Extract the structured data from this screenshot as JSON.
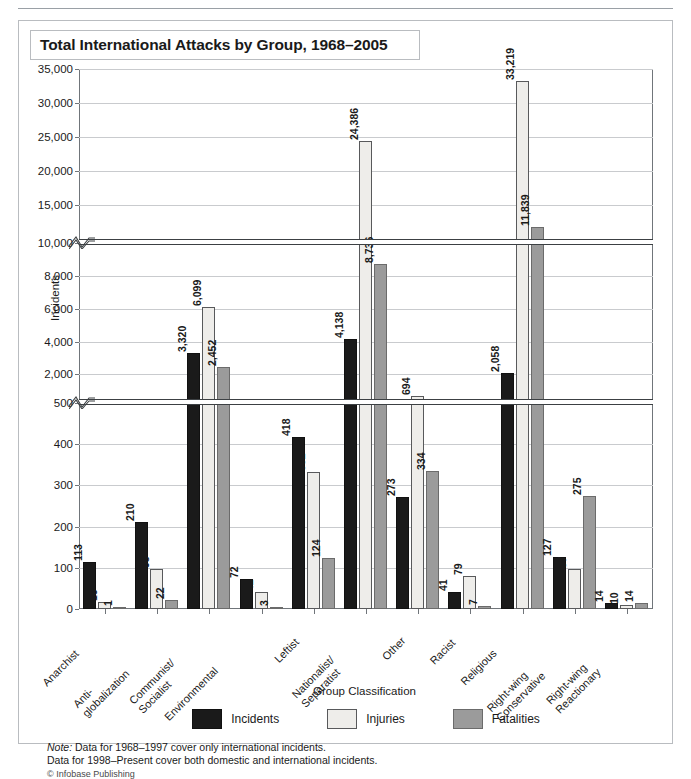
{
  "figure": {
    "title": "Total International Attacks by Group, 1968–2005",
    "credit": "© Infobase Publishing",
    "note_line1_label": "Note:",
    "note_line1": " Data for 1968–1997 cover only international incidents.",
    "note_line2": "Data for 1998–Present cover both domestic and international incidents."
  },
  "legend": {
    "position": "bottom-center",
    "items": [
      {
        "label": "Incidents",
        "color": "#1a1a1a",
        "key": "incidents"
      },
      {
        "label": "Injuries",
        "color": "#eeedea",
        "key": "injuries"
      },
      {
        "label": "Fatalities",
        "color": "#9b9b9b",
        "key": "fatalities"
      }
    ]
  },
  "chart_data": {
    "type": "bar",
    "title": "Total International Attacks by Group, 1968–2005",
    "xlabel": "Group Classification",
    "ylabel": "Incidents",
    "grid": true,
    "broken_axis": true,
    "axis_segments": [
      {
        "min": 0,
        "max": 500,
        "ticks": [
          0,
          100,
          200,
          300,
          400,
          500
        ]
      },
      {
        "min": 500,
        "max": 10000,
        "ticks": [
          2000,
          4000,
          6000,
          8000,
          10000
        ]
      },
      {
        "min": 10000,
        "max": 35000,
        "ticks": [
          15000,
          20000,
          25000,
          30000,
          35000
        ]
      }
    ],
    "tick_labels": [
      "0",
      "100",
      "200",
      "300",
      "400",
      "500",
      "2,000",
      "4,000",
      "6,000",
      "8,000",
      "10,000",
      "15,000",
      "20,000",
      "25,000",
      "30,000",
      "35,000"
    ],
    "categories": [
      "Anarchist",
      "Anti-globalization",
      "Communist/Socialist",
      "Environmental",
      "Leftist",
      "Nationalist/Separatist",
      "Other",
      "Racist",
      "Religious",
      "Right-wing Conservative",
      "Right-wing Reactionary"
    ],
    "category_lines": [
      [
        "Anarchist"
      ],
      [
        "Anti-",
        "globalization"
      ],
      [
        "Communist/",
        "Socialist"
      ],
      [
        "Environmental"
      ],
      [
        "Leftist"
      ],
      [
        "Nationalist/",
        "Separatist"
      ],
      [
        "Other"
      ],
      [
        "Racist"
      ],
      [
        "Religious"
      ],
      [
        "Right-wing",
        "Conservative"
      ],
      [
        "Right-wing",
        "Reactionary"
      ]
    ],
    "series": [
      {
        "name": "Incidents",
        "values": [
          113,
          210,
          3320,
          72,
          418,
          4138,
          273,
          41,
          2058,
          127,
          14
        ],
        "labels": [
          "113",
          "210",
          "3,320",
          "72",
          "418",
          "4,138",
          "273",
          "41",
          "2,058",
          "127",
          "14"
        ]
      },
      {
        "name": "Injuries",
        "values": [
          16,
          98,
          6099,
          42,
          332,
          24386,
          694,
          79,
          33219,
          97,
          10
        ],
        "labels": [
          "16",
          "98",
          "6,099",
          "42",
          "332",
          "24,386",
          "694",
          "79",
          "33,219",
          "97",
          "10"
        ]
      },
      {
        "name": "Fatalities",
        "values": [
          1,
          22,
          2452,
          3,
          124,
          8736,
          334,
          7,
          11839,
          275,
          14
        ],
        "labels": [
          "1",
          "22",
          "2,452",
          "3",
          "124",
          "8,736",
          "334",
          "7",
          "11,839",
          "275",
          "14"
        ]
      }
    ]
  }
}
